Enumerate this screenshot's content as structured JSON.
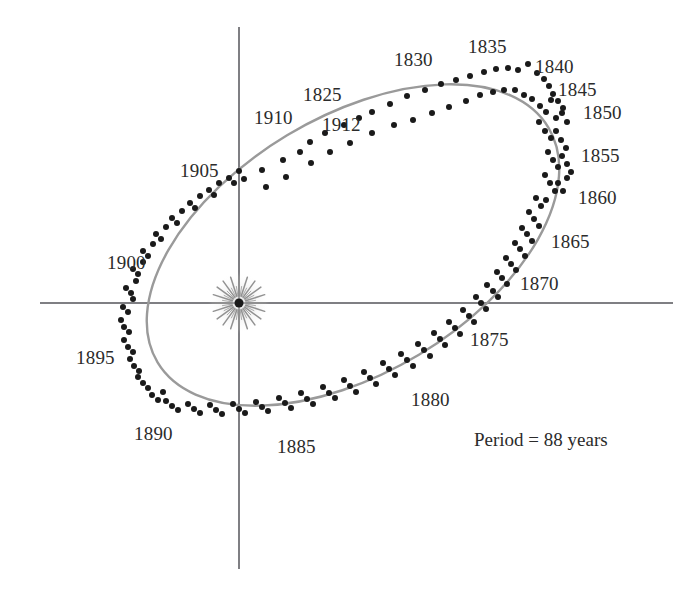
{
  "figure": {
    "caption_note": "Period = 88 years",
    "background_color": "#ffffff",
    "axis_color": "#55555a",
    "orbit_color": "#9a9a9a",
    "point_color": "#1a1a1a",
    "label_color": "#2b2b2b"
  },
  "axes": {
    "horizontal": {
      "x1": 40,
      "y1": 303,
      "x2": 673,
      "y2": 303
    },
    "vertical": {
      "x1": 239,
      "y1": 27,
      "x2": 239,
      "y2": 569
    }
  },
  "sun": {
    "name": "sun-symbol",
    "cx": 239,
    "cy": 303,
    "core_radius": 4.5,
    "ray_outer_radius": 27,
    "ray_count": 40,
    "color": "#1a1a1a",
    "glow_color": "#bfbfbf"
  },
  "orbit": {
    "cx": 353,
    "cy": 245,
    "rx": 228,
    "ry": 128,
    "rotation_deg": -31,
    "stroke_width": 2.4
  },
  "year_labels": [
    {
      "text": "1830",
      "x": 394,
      "y": 50
    },
    {
      "text": "1835",
      "x": 468,
      "y": 37
    },
    {
      "text": "1840",
      "x": 535,
      "y": 57
    },
    {
      "text": "1845",
      "x": 558,
      "y": 80
    },
    {
      "text": "1850",
      "x": 583,
      "y": 103
    },
    {
      "text": "1855",
      "x": 581,
      "y": 146
    },
    {
      "text": "1860",
      "x": 578,
      "y": 188
    },
    {
      "text": "1865",
      "x": 551,
      "y": 232
    },
    {
      "text": "1870",
      "x": 520,
      "y": 274
    },
    {
      "text": "1875",
      "x": 470,
      "y": 330
    },
    {
      "text": "1880",
      "x": 411,
      "y": 390
    },
    {
      "text": "1885",
      "x": 277,
      "y": 437
    },
    {
      "text": "1890",
      "x": 134,
      "y": 424
    },
    {
      "text": "1895",
      "x": 76,
      "y": 348
    },
    {
      "text": "1900",
      "x": 107,
      "y": 253
    },
    {
      "text": "1905",
      "x": 180,
      "y": 161
    },
    {
      "text": "1910",
      "x": 254,
      "y": 108
    },
    {
      "text": "1912",
      "x": 322,
      "y": 115
    },
    {
      "text": "1825",
      "x": 303,
      "y": 85
    }
  ],
  "period_label": {
    "text": "Period = 88 years",
    "x": 474,
    "y": 430
  },
  "chart_data": {
    "type": "scatter",
    "title": "",
    "subtitle": "",
    "xlabel": "",
    "ylabel": "",
    "annotations": [
      "Period = 88 years"
    ],
    "legend": [],
    "grid": false,
    "point_radius": 3.0,
    "points": [
      [
        244,
        179
      ],
      [
        262,
        170
      ],
      [
        283,
        160
      ],
      [
        300,
        152
      ],
      [
        266,
        187
      ],
      [
        286,
        177
      ],
      [
        310,
        142
      ],
      [
        325,
        133
      ],
      [
        344,
        125
      ],
      [
        359,
        118
      ],
      [
        311,
        163
      ],
      [
        330,
        152
      ],
      [
        350,
        143
      ],
      [
        372,
        112
      ],
      [
        390,
        104
      ],
      [
        407,
        96
      ],
      [
        372,
        133
      ],
      [
        394,
        125
      ],
      [
        413,
        120
      ],
      [
        425,
        90
      ],
      [
        441,
        84
      ],
      [
        456,
        80
      ],
      [
        432,
        113
      ],
      [
        449,
        107
      ],
      [
        466,
        101
      ],
      [
        470,
        76
      ],
      [
        484,
        72
      ],
      [
        496,
        69
      ],
      [
        480,
        95
      ],
      [
        493,
        92
      ],
      [
        504,
        90
      ],
      [
        508,
        68
      ],
      [
        518,
        70
      ],
      [
        528,
        64
      ],
      [
        515,
        90
      ],
      [
        524,
        95
      ],
      [
        532,
        99
      ],
      [
        537,
        73
      ],
      [
        544,
        79
      ],
      [
        549,
        86
      ],
      [
        540,
        106
      ],
      [
        546,
        112
      ],
      [
        551,
        100
      ],
      [
        553,
        94
      ],
      [
        558,
        101
      ],
      [
        563,
        108
      ],
      [
        556,
        118
      ],
      [
        562,
        113
      ],
      [
        567,
        122
      ],
      [
        539,
        122
      ],
      [
        545,
        131
      ],
      [
        551,
        138
      ],
      [
        556,
        131
      ],
      [
        561,
        140
      ],
      [
        566,
        148
      ],
      [
        548,
        152
      ],
      [
        553,
        160
      ],
      [
        558,
        167
      ],
      [
        562,
        156
      ],
      [
        567,
        164
      ],
      [
        571,
        172
      ],
      [
        545,
        175
      ],
      [
        550,
        183
      ],
      [
        555,
        191
      ],
      [
        558,
        183
      ],
      [
        563,
        191
      ],
      [
        567,
        178
      ],
      [
        536,
        198
      ],
      [
        541,
        206
      ],
      [
        546,
        200
      ],
      [
        529,
        212
      ],
      [
        534,
        219
      ],
      [
        539,
        226
      ],
      [
        522,
        228
      ],
      [
        527,
        234
      ],
      [
        532,
        241
      ],
      [
        515,
        243
      ],
      [
        520,
        249
      ],
      [
        525,
        256
      ],
      [
        506,
        258
      ],
      [
        511,
        264
      ],
      [
        516,
        270
      ],
      [
        497,
        272
      ],
      [
        502,
        278
      ],
      [
        507,
        284
      ],
      [
        487,
        285
      ],
      [
        493,
        291
      ],
      [
        498,
        297
      ],
      [
        476,
        297
      ],
      [
        481,
        303
      ],
      [
        486,
        309
      ],
      [
        463,
        310
      ],
      [
        469,
        316
      ],
      [
        474,
        322
      ],
      [
        449,
        322
      ],
      [
        455,
        328
      ],
      [
        460,
        334
      ],
      [
        434,
        333
      ],
      [
        440,
        339
      ],
      [
        445,
        345
      ],
      [
        418,
        344
      ],
      [
        424,
        350
      ],
      [
        430,
        356
      ],
      [
        401,
        354
      ],
      [
        407,
        360
      ],
      [
        413,
        366
      ],
      [
        383,
        363
      ],
      [
        389,
        369
      ],
      [
        395,
        375
      ],
      [
        364,
        372
      ],
      [
        370,
        378
      ],
      [
        376,
        384
      ],
      [
        344,
        380
      ],
      [
        350,
        386
      ],
      [
        356,
        392
      ],
      [
        323,
        387
      ],
      [
        329,
        393
      ],
      [
        335,
        398
      ],
      [
        301,
        393
      ],
      [
        307,
        399
      ],
      [
        313,
        404
      ],
      [
        279,
        398
      ],
      [
        285,
        403
      ],
      [
        291,
        408
      ],
      [
        256,
        402
      ],
      [
        262,
        407
      ],
      [
        268,
        411
      ],
      [
        233,
        404
      ],
      [
        239,
        409
      ],
      [
        245,
        413
      ],
      [
        210,
        405
      ],
      [
        216,
        410
      ],
      [
        222,
        414
      ],
      [
        188,
        404
      ],
      [
        194,
        409
      ],
      [
        200,
        413
      ],
      [
        166,
        401
      ],
      [
        172,
        406
      ],
      [
        178,
        410
      ],
      [
        152,
        395
      ],
      [
        158,
        400
      ],
      [
        163,
        392
      ],
      [
        143,
        383
      ],
      [
        148,
        388
      ],
      [
        138,
        377
      ],
      [
        134,
        366
      ],
      [
        139,
        371
      ],
      [
        130,
        359
      ],
      [
        128,
        347
      ],
      [
        133,
        352
      ],
      [
        124,
        340
      ],
      [
        124,
        327
      ],
      [
        129,
        332
      ],
      [
        121,
        320
      ],
      [
        123,
        307
      ],
      [
        128,
        312
      ],
      [
        133,
        299
      ],
      [
        126,
        288
      ],
      [
        131,
        293
      ],
      [
        136,
        281
      ],
      [
        133,
        269
      ],
      [
        138,
        274
      ],
      [
        143,
        262
      ],
      [
        143,
        251
      ],
      [
        148,
        256
      ],
      [
        153,
        244
      ],
      [
        156,
        234
      ],
      [
        161,
        239
      ],
      [
        166,
        227
      ],
      [
        172,
        218
      ],
      [
        177,
        223
      ],
      [
        182,
        211
      ],
      [
        190,
        203
      ],
      [
        195,
        208
      ],
      [
        200,
        196
      ],
      [
        209,
        190
      ],
      [
        214,
        195
      ],
      [
        219,
        183
      ],
      [
        229,
        178
      ],
      [
        234,
        183
      ],
      [
        239,
        171
      ]
    ],
    "labeled_years": [
      "1825",
      "1830",
      "1835",
      "1840",
      "1845",
      "1850",
      "1855",
      "1860",
      "1865",
      "1870",
      "1875",
      "1880",
      "1885",
      "1890",
      "1895",
      "1900",
      "1905",
      "1910",
      "1912"
    ],
    "year_range": [
      1825,
      1912
    ],
    "period_years": 88
  }
}
